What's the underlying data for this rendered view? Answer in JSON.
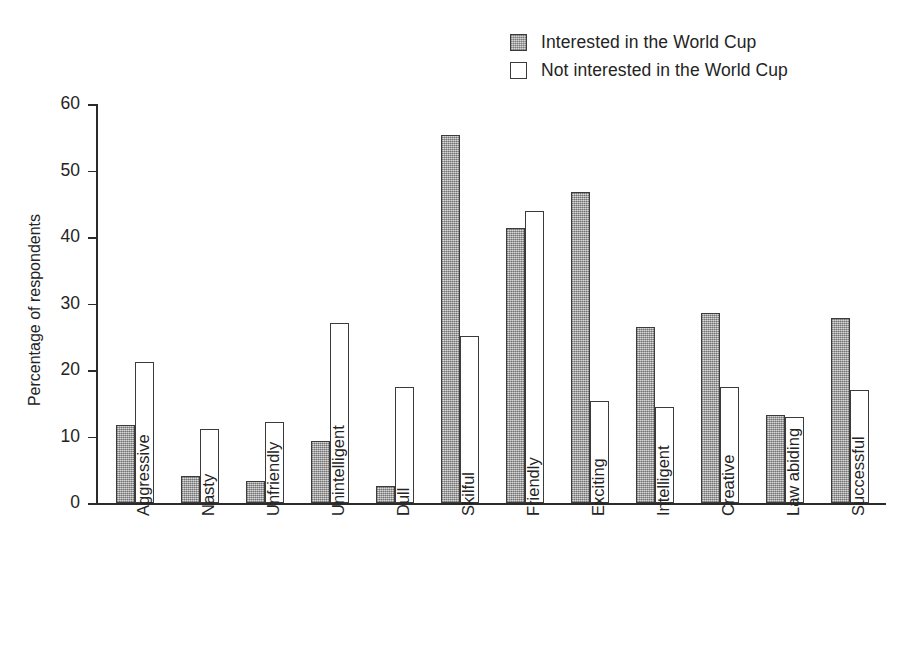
{
  "legend": {
    "position": "top-center-right",
    "items": [
      {
        "label": "Interested in the World Cup",
        "style": "filled",
        "color": "#a9a9a9"
      },
      {
        "label": "Not interested in the World Cup",
        "style": "hollow",
        "color": "#ffffff"
      }
    ]
  },
  "axis": {
    "y_title": "Percentage of respondents",
    "y_ticks": [
      "0",
      "10",
      "20",
      "30",
      "40",
      "50",
      "60"
    ]
  },
  "chart_data": {
    "type": "bar",
    "title": "",
    "subtitle": "",
    "xlabel": "",
    "ylabel": "Percentage of respondents",
    "ylim": [
      0,
      60
    ],
    "ytick_step": 10,
    "grid": false,
    "legend_position": "top-right",
    "categories": [
      "Aggressive",
      "Nasty",
      "Unfriendly",
      "Unintelligent",
      "Dull",
      "Skilful",
      "Friendly",
      "Exciting",
      "Intelligent",
      "Creative",
      "Law abiding",
      "Successful"
    ],
    "series": [
      {
        "name": "Interested in the World Cup",
        "color": "#a9a9a9",
        "values": [
          11.7,
          4.1,
          3.3,
          9.3,
          2.5,
          55.4,
          41.4,
          46.8,
          26.5,
          28.6,
          13.2,
          27.8
        ]
      },
      {
        "name": "Not interested in the World Cup",
        "color": "#ffffff",
        "values": [
          21.2,
          11.2,
          12.2,
          27.1,
          17.4,
          25.1,
          43.9,
          15.3,
          14.4,
          17.4,
          12.9,
          17.0
        ]
      }
    ]
  }
}
